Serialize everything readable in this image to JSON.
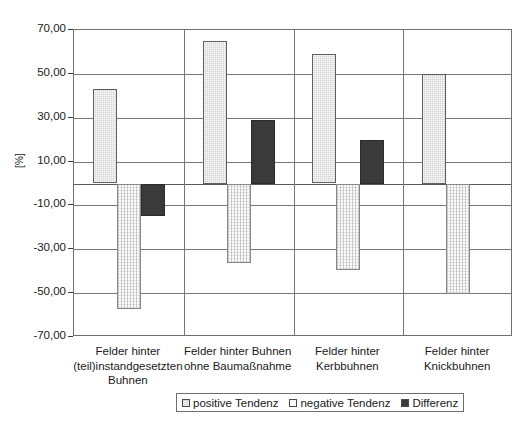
{
  "chart_data": {
    "type": "bar",
    "title": "",
    "xlabel": "",
    "ylabel": "[%]",
    "ylim": [
      -70,
      70
    ],
    "ytick_values": [
      70,
      50,
      30,
      10,
      -10,
      -30,
      -50,
      -70
    ],
    "ytick_labels": [
      "70,00",
      "50,00",
      "30,00",
      "10,00",
      "-10,00",
      "-30,00",
      "-50,00",
      "-70,00"
    ],
    "grid": true,
    "legend_position": "bottom",
    "categories": [
      "Felder hinter\n(teil)instandgesetzten\nBuhnen",
      "Felder hinter Buhnen\nohne Baumaßnahme",
      "Felder hinter\nKerbbuhnen",
      "Felder hinter\nKnickbuhnen"
    ],
    "series": [
      {
        "name": "positive Tendenz",
        "color": "#d4d4d4",
        "values": [
          43.0,
          65.0,
          59.0,
          50.0
        ]
      },
      {
        "name": "negative Tendenz",
        "color": "#fbfbfb",
        "values": [
          -57.0,
          -36.0,
          -39.0,
          -50.0
        ]
      },
      {
        "name": "Differenz",
        "color": "#3a3a3a",
        "values": [
          -14.7,
          29.0,
          20.0,
          0.0
        ]
      }
    ]
  },
  "legend": {
    "items": [
      {
        "label": "positive Tendenz",
        "swatch": "legend-swatch-positive"
      },
      {
        "label": "negative Tendenz",
        "swatch": "legend-swatch-negative"
      },
      {
        "label": "Differenz",
        "swatch": "legend-swatch-differenz"
      }
    ]
  },
  "axis": {
    "y_title": "[%]"
  }
}
